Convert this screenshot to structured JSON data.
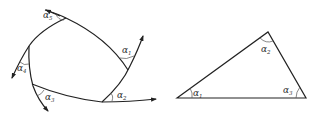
{
  "figure": {
    "left_diagram": {
      "description": "Closed curved polygon with extended tangent arrows showing exterior angles",
      "angles": [
        {
          "symbol": "α",
          "index": "1"
        },
        {
          "symbol": "α",
          "index": "2"
        },
        {
          "symbol": "α",
          "index": "3"
        },
        {
          "symbol": "α",
          "index": "4"
        },
        {
          "symbol": "α",
          "index": "5"
        }
      ]
    },
    "right_diagram": {
      "description": "Triangle with interior angles labeled",
      "angles": [
        {
          "symbol": "α",
          "index": "1"
        },
        {
          "symbol": "α",
          "index": "2"
        },
        {
          "symbol": "α",
          "index": "3"
        }
      ]
    },
    "colors": {
      "stroke": "#222222",
      "arc": "#555555",
      "background": "#ffffff"
    }
  }
}
